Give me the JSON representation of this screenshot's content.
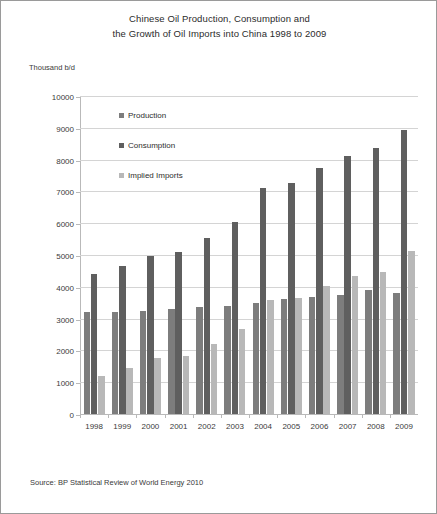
{
  "title": {
    "line1": "Chinese Oil Production, Consumption and",
    "line2": "the Growth of Oil Imports into China 1998 to 2009"
  },
  "yaxis_caption": "Thousand b/d",
  "source_note": "Source: BP Statistical Review of World Energy 2010",
  "legend": [
    {
      "label": "Production",
      "key": "production",
      "color": "#7d7d7d"
    },
    {
      "label": "Consumption",
      "key": "consumption",
      "color": "#5f5f5f"
    },
    {
      "label": "Implied Imports",
      "key": "imports",
      "color": "#b8b8b8"
    }
  ],
  "chart_data": {
    "type": "bar",
    "title": "Chinese Oil Production, Consumption and the Growth of Oil Imports into China 1998 to 2009",
    "xlabel": "",
    "ylabel": "Thousand b/d",
    "ylim": [
      0,
      10000
    ],
    "ytick_values": [
      0,
      1000,
      2000,
      3000,
      4000,
      5000,
      6000,
      7000,
      8000,
      9000,
      10000
    ],
    "ytick_labels": [
      "0",
      "1000",
      "2000",
      "3000",
      "4000",
      "5000",
      "6000",
      "7000",
      "8000",
      "9000",
      "10000"
    ],
    "grid": "horizontal",
    "legend_position": "inside-upper-left",
    "categories": [
      "1998",
      "1999",
      "2000",
      "2001",
      "2002",
      "2003",
      "2004",
      "2005",
      "2006",
      "2007",
      "2008",
      "2009"
    ],
    "series": [
      {
        "name": "Production",
        "color": "#7d7d7d",
        "values": [
          3200,
          3210,
          3250,
          3300,
          3350,
          3400,
          3480,
          3620,
          3690,
          3750,
          3900,
          3800
        ]
      },
      {
        "name": "Consumption",
        "color": "#5f5f5f",
        "values": [
          4400,
          4650,
          4980,
          5100,
          5550,
          6050,
          7100,
          7280,
          7730,
          8100,
          8380,
          8920
        ]
      },
      {
        "name": "Implied Imports",
        "color": "#b8b8b8",
        "values": [
          1200,
          1450,
          1750,
          1830,
          2200,
          2660,
          3600,
          3640,
          4030,
          4350,
          4480,
          5120
        ]
      }
    ]
  }
}
